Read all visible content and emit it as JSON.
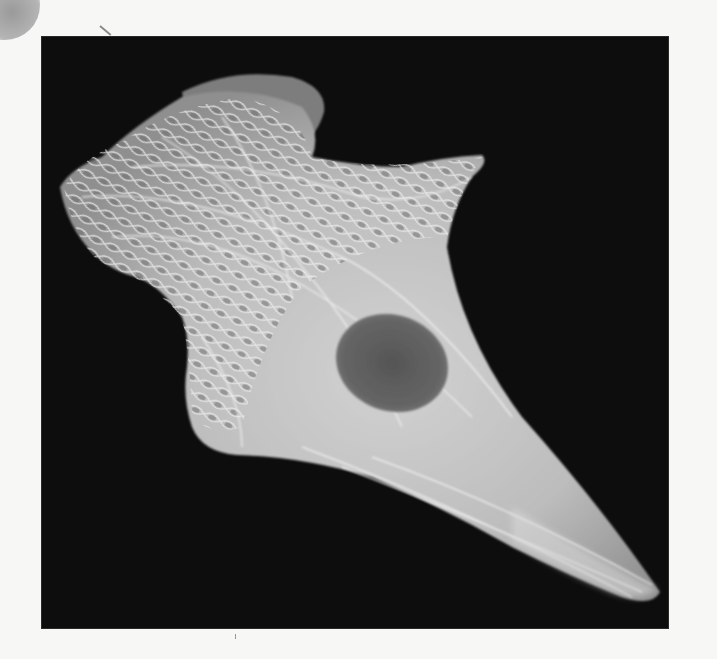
{
  "page": {
    "type": "scanned-textbook-page",
    "background_color": "#f7f7f5"
  },
  "figure": {
    "background_color": "#0d0d0d",
    "cell_color": "#c9c9c9",
    "nucleus_color": "#5e5e5e",
    "alt": "Micrograph of a spread cell with a dense web of fluorescent filaments and a dark oval nucleus"
  }
}
